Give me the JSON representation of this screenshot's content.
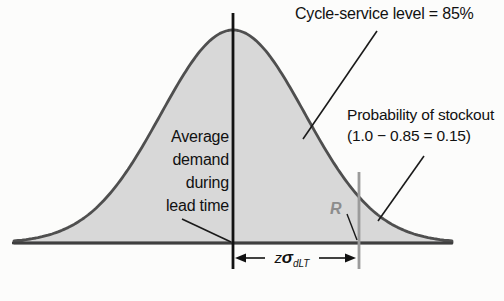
{
  "figure": {
    "cycle_service_label": "Cycle-service level = 85%",
    "stockout_label": {
      "line1": "Probability of stockout",
      "line2": "(1.0 − 0.85 = 0.15)"
    },
    "avg_demand": {
      "line1": "Average",
      "line2": "demand",
      "line3": "during",
      "line4": "lead time"
    },
    "reorder_point_label": "R",
    "z_sigma": {
      "z": "z",
      "sigma": "σ",
      "subscript": "dLT"
    },
    "colors": {
      "curve_fill": "#d8d8d8",
      "curve_stroke": "#4f4f4f",
      "axis_line": "#3f3f3f",
      "mean_line": "#121212",
      "reorder_line": "#9b9b9b",
      "reorder_label": "#8c8c8c",
      "leader_line": "#1a1a1a",
      "text": "#111111"
    }
  }
}
